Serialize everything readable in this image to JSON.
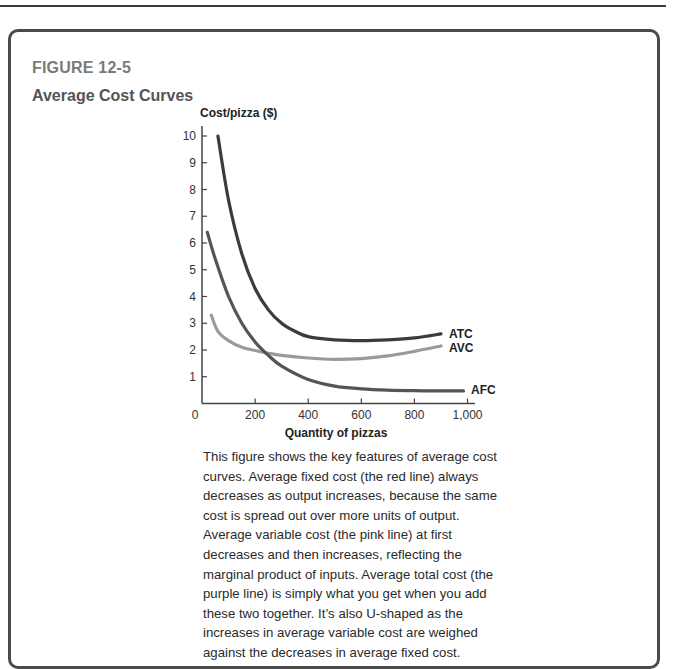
{
  "figure": {
    "label": "FIGURE 12-5",
    "title": "Average Cost Curves",
    "caption": "This figure shows the key features of average cost curves. Average fixed cost (the red line) always decreases as output increases, because the same cost is spread out over more units of output. Average variable cost (the pink line) at first decreases and then increases, reflecting the marginal product of inputs. Average total cost (the purple line) is simply what you get when you add these two together. It’s also U-shaped as the increases in average variable cost are weighed against the decreases in average fixed cost."
  },
  "chart_data": {
    "type": "line",
    "title": "Average Cost Curves",
    "xlabel": "Quantity of pizzas",
    "ylabel": "Cost/pizza ($)",
    "xlim": [
      0,
      1000
    ],
    "ylim": [
      0,
      10
    ],
    "x_ticks": [
      "0",
      "200",
      "400",
      "600",
      "800",
      "1,000"
    ],
    "y_ticks": [
      "1",
      "2",
      "3",
      "4",
      "5",
      "6",
      "7",
      "8",
      "9",
      "10"
    ],
    "grid": false,
    "legend": "inline labels at right end of curves",
    "series": [
      {
        "name": "ATC",
        "color": "#3b3b3b",
        "points": [
          [
            60,
            10.0
          ],
          [
            100,
            7.6
          ],
          [
            150,
            5.6
          ],
          [
            200,
            4.3
          ],
          [
            250,
            3.5
          ],
          [
            300,
            3.0
          ],
          [
            350,
            2.7
          ],
          [
            400,
            2.5
          ],
          [
            500,
            2.38
          ],
          [
            600,
            2.35
          ],
          [
            700,
            2.38
          ],
          [
            800,
            2.45
          ],
          [
            900,
            2.6
          ]
        ]
      },
      {
        "name": "AVC",
        "color": "#9a9a9a",
        "points": [
          [
            35,
            3.3
          ],
          [
            60,
            2.7
          ],
          [
            100,
            2.35
          ],
          [
            150,
            2.1
          ],
          [
            200,
            1.98
          ],
          [
            250,
            1.88
          ],
          [
            300,
            1.8
          ],
          [
            400,
            1.7
          ],
          [
            500,
            1.65
          ],
          [
            600,
            1.68
          ],
          [
            700,
            1.78
          ],
          [
            800,
            1.95
          ],
          [
            900,
            2.15
          ]
        ]
      },
      {
        "name": "AFC",
        "color": "#555555",
        "points": [
          [
            20,
            6.4
          ],
          [
            50,
            5.4
          ],
          [
            100,
            4.0
          ],
          [
            150,
            3.0
          ],
          [
            200,
            2.3
          ],
          [
            250,
            1.8
          ],
          [
            300,
            1.4
          ],
          [
            400,
            0.9
          ],
          [
            500,
            0.65
          ],
          [
            600,
            0.55
          ],
          [
            700,
            0.5
          ],
          [
            800,
            0.48
          ],
          [
            900,
            0.47
          ],
          [
            985,
            0.47
          ]
        ]
      }
    ]
  }
}
